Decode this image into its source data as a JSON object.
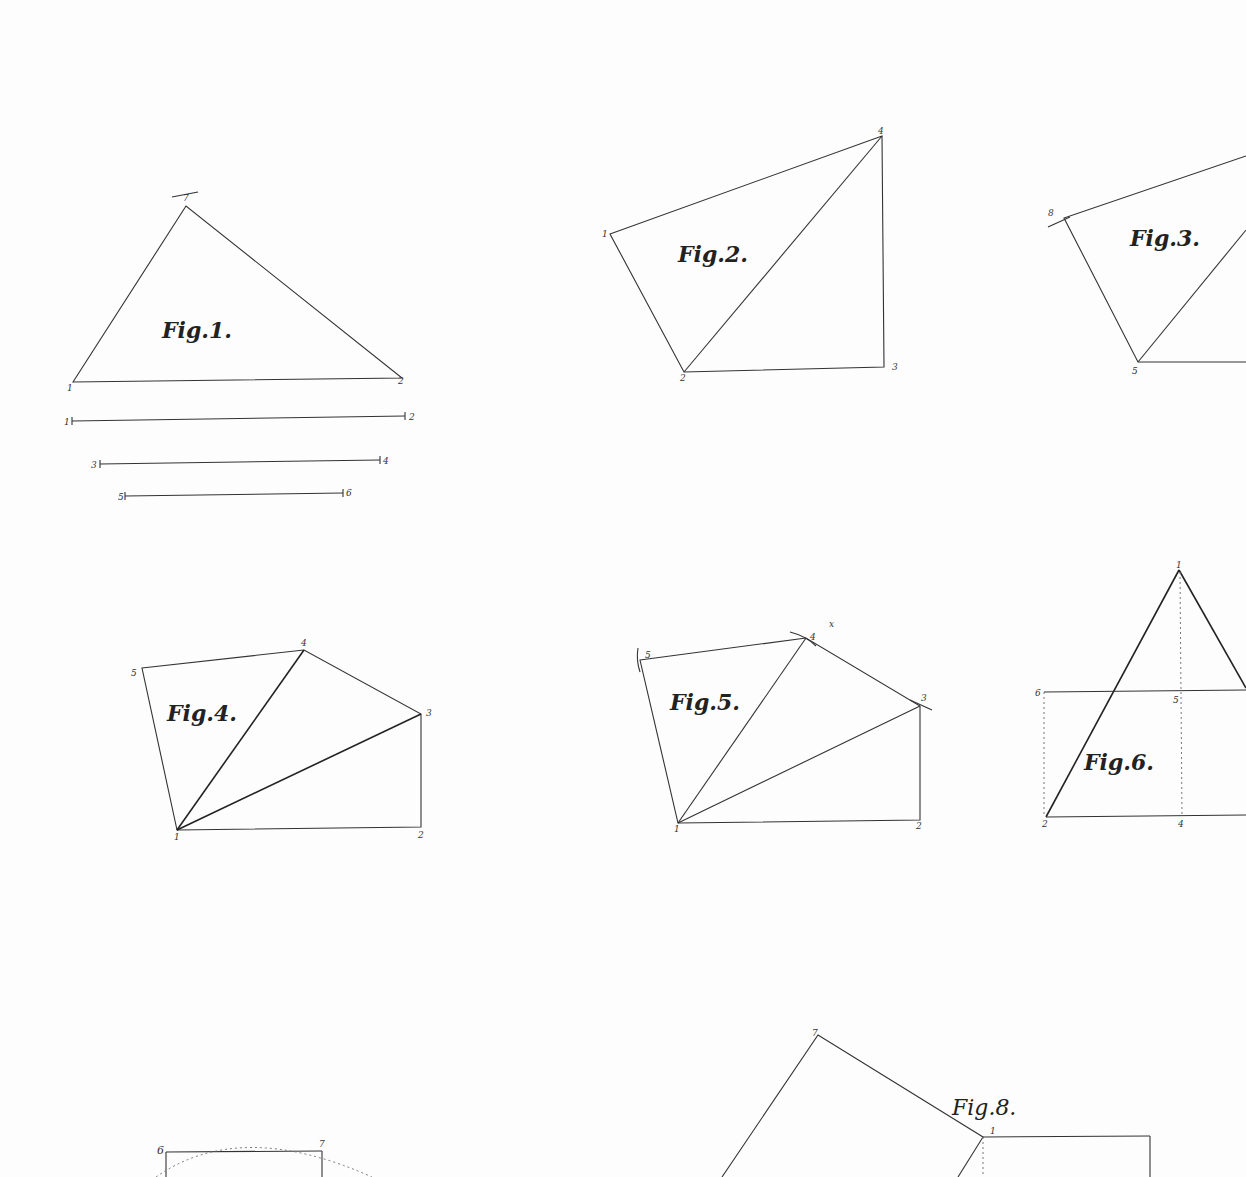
{
  "plate": {
    "figures": [
      {
        "id": "fig1",
        "title": "Fig.1.",
        "labels": [
          "7",
          "1",
          "2",
          "1",
          "2",
          "3",
          "4",
          "5",
          "6"
        ]
      },
      {
        "id": "fig2",
        "title": "Fig.2.",
        "labels": [
          "1",
          "2",
          "3",
          "4"
        ]
      },
      {
        "id": "fig3",
        "title": "Fig.3.",
        "labels": [
          "8",
          "5"
        ]
      },
      {
        "id": "fig4",
        "title": "Fig.4.",
        "labels": [
          "5",
          "4",
          "3",
          "1",
          "2"
        ]
      },
      {
        "id": "fig5",
        "title": "Fig.5.",
        "labels": [
          "5",
          "4",
          "3",
          "1",
          "2",
          "x"
        ]
      },
      {
        "id": "fig6",
        "title": "Fig.6.",
        "labels": [
          "1",
          "6",
          "5",
          "2",
          "4"
        ]
      },
      {
        "id": "fig7",
        "title": "",
        "labels": [
          "6",
          "7"
        ]
      },
      {
        "id": "fig8",
        "title": "Fig.8.",
        "labels": [
          "7",
          "1"
        ]
      }
    ]
  }
}
